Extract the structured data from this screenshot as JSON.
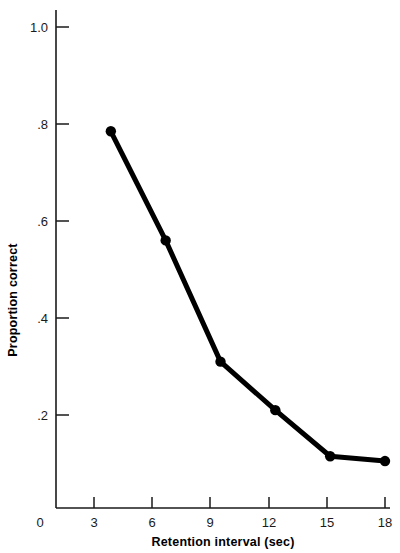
{
  "chart_data": {
    "type": "line",
    "title": "",
    "xlabel": "Retention interval (sec)",
    "ylabel": "Proportion correct",
    "x": [
      3,
      6,
      9,
      12,
      15,
      18
    ],
    "values": [
      0.785,
      0.56,
      0.31,
      0.21,
      0.115,
      0.105
    ],
    "series": [
      {
        "name": "Proportion correct",
        "values": [
          0.785,
          0.56,
          0.31,
          0.21,
          0.115,
          0.105
        ]
      }
    ],
    "xlim": [
      0,
      18
    ],
    "ylim": [
      0,
      1.0
    ],
    "xticks": [
      0,
      3,
      6,
      9,
      12,
      15,
      18
    ],
    "xticklabels": [
      "0",
      "3",
      "6",
      "9",
      "12",
      "15",
      "18"
    ],
    "yticks": [
      0.2,
      0.4,
      0.6,
      0.8,
      1.0
    ],
    "yticklabels": [
      ".2",
      ".4",
      ".6",
      ".8",
      "1.0"
    ],
    "grid": false,
    "legend": false,
    "marker": "filled-circle",
    "line_color": "#000000",
    "marker_color": "#000000",
    "background_color": "#ffffff"
  },
  "axis": {
    "y_title": "Proportion correct",
    "x_title": "Retention interval (sec)",
    "y_tick_labels": [
      "1.0",
      ".8",
      ".6",
      ".4",
      ".2"
    ],
    "x_tick_labels": [
      "0",
      "3",
      "6",
      "9",
      "12",
      "15",
      "18"
    ]
  }
}
